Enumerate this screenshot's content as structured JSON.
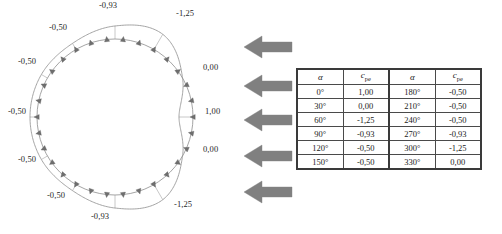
{
  "figure": {
    "type": "polar-pressure-distribution",
    "wind_arrows": {
      "count": 5,
      "direction": "left",
      "color": "#808080",
      "name": "wind-direction-arrow"
    },
    "cylinder": {
      "center_x": 115,
      "center_y": 117,
      "radius": 78
    },
    "labels": [
      {
        "angle": 0,
        "value": "1,00",
        "x": 205,
        "y": 112,
        "anchor": "left"
      },
      {
        "angle": 30,
        "value": "0,00",
        "x": 203,
        "y": 150,
        "anchor": "left"
      },
      {
        "angle": 60,
        "value": "-1,25",
        "x": 174,
        "y": 205,
        "anchor": "left"
      },
      {
        "angle": 90,
        "value": "-0,93",
        "x": 100,
        "y": 217,
        "anchor": "center"
      },
      {
        "angle": 120,
        "value": "-0,50",
        "x": 56,
        "y": 196,
        "anchor": "center"
      },
      {
        "angle": 150,
        "value": "-0,50",
        "x": 27,
        "y": 160,
        "anchor": "center"
      },
      {
        "angle": 180,
        "value": "-0,50",
        "x": 17,
        "y": 112,
        "anchor": "center"
      },
      {
        "angle": 210,
        "value": "-0,50",
        "x": 27,
        "y": 62,
        "anchor": "center"
      },
      {
        "angle": 240,
        "value": "-0,50",
        "x": 58,
        "y": 28,
        "anchor": "center"
      },
      {
        "angle": 270,
        "value": "-0,93",
        "x": 108,
        "y": 6,
        "anchor": "center"
      },
      {
        "angle": 300,
        "value": "-1,25",
        "x": 176,
        "y": 14,
        "anchor": "left"
      },
      {
        "angle": 330,
        "value": "0,00",
        "x": 203,
        "y": 68,
        "anchor": "left"
      }
    ]
  },
  "chart_data": {
    "type": "line",
    "title": "",
    "xlabel": "α",
    "ylabel": "c_pe",
    "categories": [
      "0°",
      "30°",
      "60°",
      "90°",
      "120°",
      "150°",
      "180°",
      "210°",
      "240°",
      "270°",
      "300°",
      "330°"
    ],
    "values": [
      1.0,
      0.0,
      -1.25,
      -0.93,
      -0.5,
      -0.5,
      -0.5,
      -0.5,
      -0.5,
      -0.93,
      -1.25,
      0.0
    ],
    "value_labels": [
      "1,00",
      "0,00",
      "-1,25",
      "-0,93",
      "-0,50",
      "-0,50",
      "-0,50",
      "-0,50",
      "-0,50",
      "-0,93",
      "-1,25",
      "0,00"
    ],
    "grid": false,
    "legend": "none",
    "ylim": [
      -1.25,
      1.0
    ]
  },
  "table": {
    "name": "cpe-values-table",
    "headers": [
      "α",
      "c",
      "α",
      "c"
    ],
    "header_subscripts": [
      "",
      "pe",
      "",
      "pe"
    ],
    "rows": [
      {
        "alpha_left": "0°",
        "cpe_left": "1,00",
        "alpha_right": "180°",
        "cpe_right": "-0,50"
      },
      {
        "alpha_left": "30°",
        "cpe_left": "0,00",
        "alpha_right": "210°",
        "cpe_right": "-0,50"
      },
      {
        "alpha_left": "60°",
        "cpe_left": "-1,25",
        "alpha_right": "240°",
        "cpe_right": "-0,50"
      },
      {
        "alpha_left": "90°",
        "cpe_left": "-0,93",
        "alpha_right": "270°",
        "cpe_right": "-0,93"
      },
      {
        "alpha_left": "120°",
        "cpe_left": "-0,50",
        "alpha_right": "300°",
        "cpe_right": "-1,25"
      },
      {
        "alpha_left": "150°",
        "cpe_left": "-0,50",
        "alpha_right": "330°",
        "cpe_right": "0,00"
      }
    ]
  },
  "colors": {
    "curve": "#9a9a9a",
    "arrow_fill": "#808080",
    "table_border": "#3a3a3a",
    "text": "#1a1a1a",
    "background": "#ffffff"
  }
}
